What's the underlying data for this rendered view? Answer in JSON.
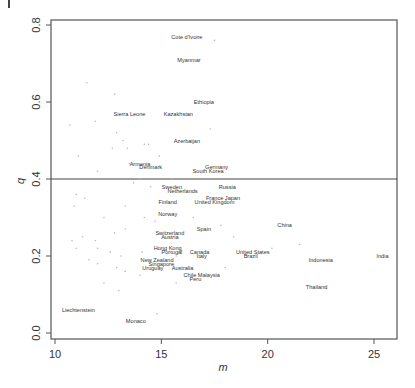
{
  "chart_data": {
    "type": "scatter",
    "title": "",
    "xlabel": "m",
    "ylabel": "q",
    "xlim": [
      9.8,
      26.2
    ],
    "ylim": [
      -0.01,
      0.82
    ],
    "xticks": [
      10,
      15,
      20,
      25
    ],
    "yticks": [
      0.0,
      0.2,
      0.4,
      0.6,
      0.8
    ],
    "xtick_labels": [
      "10",
      "15",
      "20",
      "25"
    ],
    "ytick_labels": [
      "0.0",
      "0.2",
      "0.4",
      "0.6",
      "0.8"
    ],
    "grid": false,
    "legend": null,
    "reference_line": {
      "orientation": "horizontal",
      "y": 0.4
    },
    "labeled_points": [
      {
        "label": "Cote d'Ivoire",
        "m": 16.2,
        "q": 0.77
      },
      {
        "label": "Myanmar",
        "m": 16.3,
        "q": 0.71
      },
      {
        "label": "Ethiopia",
        "m": 17.0,
        "q": 0.6
      },
      {
        "label": "Sierra Leone",
        "m": 13.5,
        "q": 0.57
      },
      {
        "label": "Kazakhstan",
        "m": 15.8,
        "q": 0.57
      },
      {
        "label": "Azerbaijan",
        "m": 16.2,
        "q": 0.5
      },
      {
        "label": "Armenia",
        "m": 14.0,
        "q": 0.44
      },
      {
        "label": "Denmark",
        "m": 14.5,
        "q": 0.43
      },
      {
        "label": "Germany",
        "m": 17.6,
        "q": 0.43
      },
      {
        "label": "South Korea",
        "m": 17.2,
        "q": 0.42
      },
      {
        "label": "Sweden",
        "m": 15.5,
        "q": 0.38
      },
      {
        "label": "Netherlands",
        "m": 16.0,
        "q": 0.37
      },
      {
        "label": "Russia",
        "m": 18.1,
        "q": 0.38
      },
      {
        "label": "France Japan",
        "m": 17.9,
        "q": 0.35
      },
      {
        "label": "United Kingdom",
        "m": 17.5,
        "q": 0.34
      },
      {
        "label": "Finland",
        "m": 15.3,
        "q": 0.34
      },
      {
        "label": "Norway",
        "m": 15.3,
        "q": 0.31
      },
      {
        "label": "China",
        "m": 20.8,
        "q": 0.28
      },
      {
        "label": "Spain",
        "m": 17.0,
        "q": 0.27
      },
      {
        "label": "Switzerland",
        "m": 15.4,
        "q": 0.26
      },
      {
        "label": "Austria",
        "m": 15.4,
        "q": 0.25
      },
      {
        "label": "Hong Kong",
        "m": 15.3,
        "q": 0.22
      },
      {
        "label": "Portugal",
        "m": 15.5,
        "q": 0.21
      },
      {
        "label": "Canada",
        "m": 16.8,
        "q": 0.21
      },
      {
        "label": "Italy",
        "m": 16.9,
        "q": 0.2
      },
      {
        "label": "United States",
        "m": 19.3,
        "q": 0.21
      },
      {
        "label": "Brazil",
        "m": 19.2,
        "q": 0.2
      },
      {
        "label": "New Zealand",
        "m": 14.8,
        "q": 0.19
      },
      {
        "label": "Singapore",
        "m": 15.0,
        "q": 0.18
      },
      {
        "label": "Uruguay",
        "m": 14.6,
        "q": 0.17
      },
      {
        "label": "Australia",
        "m": 16.0,
        "q": 0.17
      },
      {
        "label": "Chile Malaysia",
        "m": 16.9,
        "q": 0.15
      },
      {
        "label": "Peru",
        "m": 16.6,
        "q": 0.14
      },
      {
        "label": "Indonesia",
        "m": 22.5,
        "q": 0.19
      },
      {
        "label": "India",
        "m": 25.4,
        "q": 0.2
      },
      {
        "label": "Thailand",
        "m": 22.3,
        "q": 0.12
      },
      {
        "label": "Liechtenstein",
        "m": 11.1,
        "q": 0.06
      },
      {
        "label": "Monaco",
        "m": 13.8,
        "q": 0.03
      }
    ],
    "unlabeled_points": [
      [
        17.5,
        0.76
      ],
      [
        11.5,
        0.65
      ],
      [
        12.8,
        0.62
      ],
      [
        11.9,
        0.55
      ],
      [
        10.7,
        0.54
      ],
      [
        17.3,
        0.53
      ],
      [
        12.9,
        0.52
      ],
      [
        13.2,
        0.5
      ],
      [
        13.4,
        0.48
      ],
      [
        12.7,
        0.48
      ],
      [
        14.2,
        0.49
      ],
      [
        14.4,
        0.49
      ],
      [
        11.1,
        0.46
      ],
      [
        14.9,
        0.46
      ],
      [
        13.5,
        0.44
      ],
      [
        12.0,
        0.42
      ],
      [
        15.5,
        0.4
      ],
      [
        14.0,
        0.4
      ],
      [
        13.7,
        0.39
      ],
      [
        14.5,
        0.38
      ],
      [
        11.0,
        0.36
      ],
      [
        11.4,
        0.35
      ],
      [
        10.9,
        0.33
      ],
      [
        13.3,
        0.33
      ],
      [
        12.3,
        0.3
      ],
      [
        14.2,
        0.3
      ],
      [
        14.7,
        0.29
      ],
      [
        13.3,
        0.27
      ],
      [
        12.8,
        0.26
      ],
      [
        11.3,
        0.25
      ],
      [
        11.9,
        0.24
      ],
      [
        10.8,
        0.24
      ],
      [
        11.0,
        0.22
      ],
      [
        12.0,
        0.22
      ],
      [
        12.6,
        0.21
      ],
      [
        14.1,
        0.21
      ],
      [
        15.7,
        0.2
      ],
      [
        13.1,
        0.2
      ],
      [
        11.6,
        0.19
      ],
      [
        12.0,
        0.18
      ],
      [
        12.9,
        0.17
      ],
      [
        13.3,
        0.16
      ],
      [
        14.0,
        0.15
      ],
      [
        12.3,
        0.13
      ],
      [
        13.0,
        0.11
      ],
      [
        14.8,
        0.05
      ],
      [
        15.7,
        0.13
      ],
      [
        18.4,
        0.25
      ],
      [
        18.0,
        0.17
      ],
      [
        21.5,
        0.23
      ],
      [
        22.7,
        0.12
      ],
      [
        20.2,
        0.22
      ],
      [
        17.8,
        0.28
      ],
      [
        16.5,
        0.3
      ]
    ]
  },
  "figure": {
    "x_axis_label": "m",
    "y_axis_label": "q"
  }
}
